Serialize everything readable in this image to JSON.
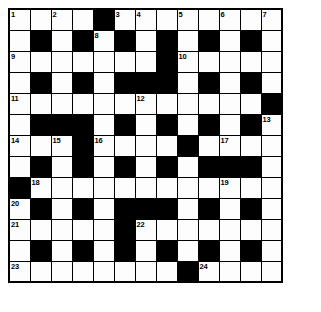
{
  "puzzle": {
    "type": "crossword-grid",
    "title": "Crossword Grid",
    "rows": 13,
    "cols": 13,
    "colors": {
      "block": "#000000",
      "cell": "#fdfdfd",
      "grid_line": "#000000",
      "number_text": "#000000",
      "background": "#ffffff"
    },
    "grid": [
      [
        "W",
        "W",
        "W",
        "W",
        "B",
        "W",
        "W",
        "W",
        "W",
        "W",
        "W",
        "W",
        "W"
      ],
      [
        "W",
        "B",
        "W",
        "B",
        "W",
        "B",
        "W",
        "B",
        "W",
        "B",
        "W",
        "B",
        "W"
      ],
      [
        "W",
        "W",
        "W",
        "W",
        "W",
        "W",
        "W",
        "B",
        "W",
        "W",
        "W",
        "W",
        "W"
      ],
      [
        "W",
        "B",
        "W",
        "B",
        "W",
        "B",
        "B",
        "B",
        "W",
        "B",
        "W",
        "B",
        "W"
      ],
      [
        "W",
        "W",
        "W",
        "W",
        "W",
        "W",
        "W",
        "W",
        "W",
        "W",
        "W",
        "W",
        "B"
      ],
      [
        "W",
        "B",
        "B",
        "B",
        "W",
        "B",
        "W",
        "B",
        "W",
        "B",
        "W",
        "B",
        "W"
      ],
      [
        "W",
        "W",
        "W",
        "B",
        "W",
        "W",
        "W",
        "W",
        "B",
        "W",
        "W",
        "W",
        "W"
      ],
      [
        "W",
        "B",
        "W",
        "B",
        "W",
        "B",
        "W",
        "B",
        "W",
        "B",
        "B",
        "B",
        "W"
      ],
      [
        "B",
        "W",
        "W",
        "W",
        "W",
        "W",
        "W",
        "W",
        "W",
        "W",
        "W",
        "W",
        "W"
      ],
      [
        "W",
        "B",
        "W",
        "B",
        "W",
        "B",
        "B",
        "B",
        "W",
        "B",
        "W",
        "B",
        "W"
      ],
      [
        "W",
        "W",
        "W",
        "W",
        "W",
        "B",
        "W",
        "W",
        "W",
        "W",
        "W",
        "W",
        "W"
      ],
      [
        "W",
        "B",
        "W",
        "B",
        "W",
        "B",
        "W",
        "B",
        "W",
        "B",
        "W",
        "B",
        "W"
      ],
      [
        "W",
        "W",
        "W",
        "W",
        "W",
        "W",
        "W",
        "W",
        "B",
        "W",
        "W",
        "W",
        "W"
      ]
    ],
    "numbers": [
      {
        "row": 0,
        "col": 0,
        "label": "1"
      },
      {
        "row": 0,
        "col": 2,
        "label": "2"
      },
      {
        "row": 0,
        "col": 5,
        "label": "3"
      },
      {
        "row": 0,
        "col": 6,
        "label": "4"
      },
      {
        "row": 0,
        "col": 8,
        "label": "5"
      },
      {
        "row": 0,
        "col": 10,
        "label": "6"
      },
      {
        "row": 0,
        "col": 12,
        "label": "7"
      },
      {
        "row": 1,
        "col": 4,
        "label": "8"
      },
      {
        "row": 2,
        "col": 0,
        "label": "9"
      },
      {
        "row": 2,
        "col": 8,
        "label": "10"
      },
      {
        "row": 4,
        "col": 0,
        "label": "11"
      },
      {
        "row": 4,
        "col": 6,
        "label": "12"
      },
      {
        "row": 5,
        "col": 12,
        "label": "13"
      },
      {
        "row": 6,
        "col": 0,
        "label": "14"
      },
      {
        "row": 6,
        "col": 2,
        "label": "15"
      },
      {
        "row": 6,
        "col": 4,
        "label": "16"
      },
      {
        "row": 6,
        "col": 10,
        "label": "17"
      },
      {
        "row": 8,
        "col": 1,
        "label": "18"
      },
      {
        "row": 8,
        "col": 10,
        "label": "19"
      },
      {
        "row": 9,
        "col": 0,
        "label": "20"
      },
      {
        "row": 10,
        "col": 0,
        "label": "21"
      },
      {
        "row": 10,
        "col": 6,
        "label": "22"
      },
      {
        "row": 12,
        "col": 0,
        "label": "23"
      },
      {
        "row": 12,
        "col": 9,
        "label": "24"
      }
    ]
  }
}
